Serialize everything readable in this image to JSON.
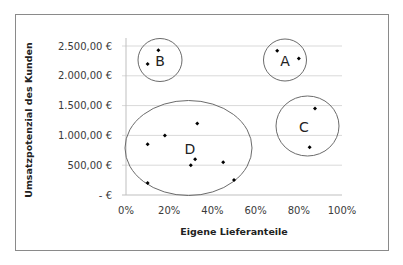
{
  "chart_data": {
    "type": "scatter",
    "title": "",
    "xlabel": "Eigene Lieferanteile",
    "ylabel": "Umsatzpotenzial des Kunden",
    "xlim": [
      0,
      100
    ],
    "ylim": [
      0,
      2500
    ],
    "x_ticks": [
      0,
      20,
      40,
      60,
      80,
      100
    ],
    "x_tick_labels": [
      "0%",
      "20%",
      "40%",
      "60%",
      "80%",
      "100%"
    ],
    "y_ticks": [
      0,
      500,
      1000,
      1500,
      2000,
      2500
    ],
    "y_tick_labels": [
      "-  €",
      "500,00  €",
      "1.000,00  €",
      "1.500,00  €",
      "2.000,00  €",
      "2.500,00  €"
    ],
    "grid": "horizontal",
    "legend": "none",
    "points": [
      {
        "x": 10,
        "y": 2200,
        "cluster": "B"
      },
      {
        "x": 15,
        "y": 2430,
        "cluster": "B"
      },
      {
        "x": 70,
        "y": 2420,
        "cluster": "A"
      },
      {
        "x": 80,
        "y": 2290,
        "cluster": "A"
      },
      {
        "x": 87.5,
        "y": 1450,
        "cluster": "C"
      },
      {
        "x": 85,
        "y": 800,
        "cluster": "C"
      },
      {
        "x": 33,
        "y": 1200,
        "cluster": "D"
      },
      {
        "x": 18,
        "y": 1000,
        "cluster": "D"
      },
      {
        "x": 10,
        "y": 850,
        "cluster": "D"
      },
      {
        "x": 32,
        "y": 600,
        "cluster": "D"
      },
      {
        "x": 30,
        "y": 500,
        "cluster": "D"
      },
      {
        "x": 45,
        "y": 550,
        "cluster": "D"
      },
      {
        "x": 10,
        "y": 200,
        "cluster": "D"
      },
      {
        "x": 50,
        "y": 250,
        "cluster": "D"
      }
    ],
    "clusters": [
      {
        "label": "A",
        "cx": 73,
        "cy": 2250,
        "rx": 10,
        "ry": 360
      },
      {
        "label": "B",
        "cx": 16018,
        "cy": 0,
        "rx": 0,
        "ry": 0
      }
    ]
  }
}
